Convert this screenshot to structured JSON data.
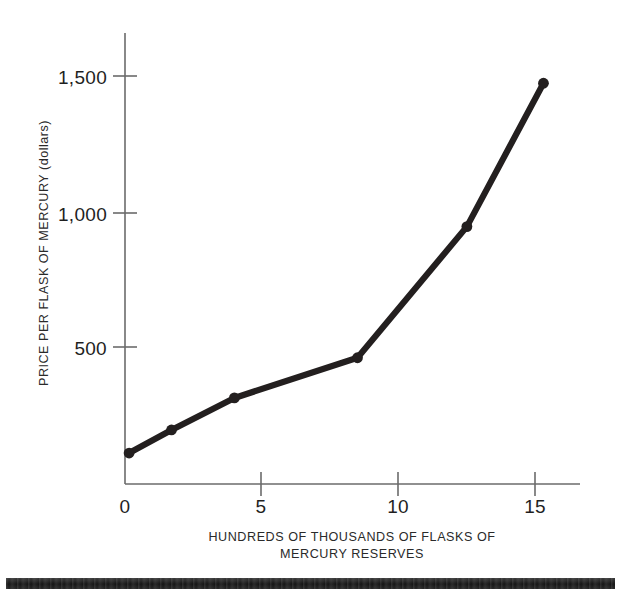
{
  "chart_data": {
    "type": "line",
    "title": "",
    "xlabel": "HUNDREDS OF THOUSANDS OF FLASKS OF MERCURY RESERVES",
    "ylabel": "PRICE PER FLASK OF MERCURY (dollars)",
    "xlabel_line1": "HUNDREDS OF THOUSANDS OF FLASKS OF",
    "xlabel_line2": "MERCURY RESERVES",
    "xlim": [
      0,
      16.7
    ],
    "ylim": [
      0,
      1660
    ],
    "xticks": [
      0,
      5,
      10,
      15
    ],
    "xtick_labels": [
      "0",
      "5",
      "10",
      "15"
    ],
    "yticks": [
      500,
      1000,
      1500
    ],
    "ytick_labels": [
      "500",
      "1,000",
      "1,500"
    ],
    "grid": false,
    "legend": false,
    "marker": "circle",
    "line_color": "#231f1f",
    "axis_color": "#6b6b6b",
    "x": [
      0.15,
      1.7,
      4.0,
      8.5,
      12.5,
      15.3
    ],
    "values": [
      114,
      199,
      317,
      465,
      948,
      1476
    ],
    "points": [
      {
        "x": 0.15,
        "y": 114
      },
      {
        "x": 1.7,
        "y": 199
      },
      {
        "x": 4.0,
        "y": 317
      },
      {
        "x": 8.5,
        "y": 465
      },
      {
        "x": 12.5,
        "y": 948
      },
      {
        "x": 15.3,
        "y": 1476
      }
    ]
  },
  "footer": {
    "bar_color": "#1c1c1c"
  }
}
